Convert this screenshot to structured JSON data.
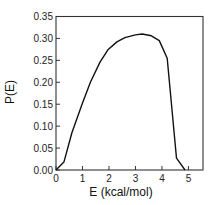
{
  "chart_data": {
    "type": "line",
    "title": "",
    "xlabel": "E (kcal/mol)",
    "ylabel": "P(E)",
    "xlim": [
      0,
      5.55
    ],
    "ylim": [
      0,
      0.35
    ],
    "grid": false,
    "legend": null,
    "xticks": [
      0,
      1,
      2,
      3,
      4,
      5
    ],
    "xtick_labels": [
      "0",
      "1",
      "2",
      "3",
      "4",
      "5"
    ],
    "yticks": [
      0.0,
      0.05,
      0.1,
      0.15,
      0.2,
      0.25,
      0.3,
      0.35
    ],
    "ytick_labels": [
      "0.00",
      "0.05",
      "0.10",
      "0.15",
      "0.20",
      "0.25",
      "0.30",
      "0.35"
    ],
    "series": [
      {
        "name": "P(E)",
        "color": "#111111",
        "x": [
          0.0,
          0.3,
          0.6,
          1.0,
          1.3,
          1.66,
          1.96,
          2.3,
          2.6,
          3.0,
          3.25,
          3.6,
          3.9,
          4.2,
          4.55,
          4.87
        ],
        "y": [
          0.0,
          0.018,
          0.085,
          0.153,
          0.2,
          0.246,
          0.274,
          0.292,
          0.302,
          0.308,
          0.31,
          0.306,
          0.295,
          0.255,
          0.027,
          0.0
        ]
      }
    ]
  }
}
